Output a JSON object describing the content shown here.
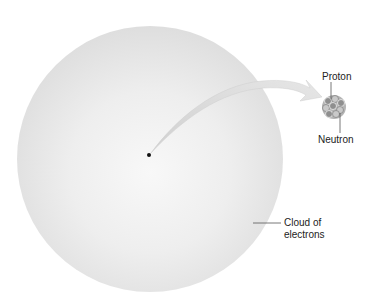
{
  "diagram": {
    "labels": {
      "proton": "Proton",
      "neutron": "Neutron",
      "cloud_line1": "Cloud of",
      "cloud_line2": "electrons"
    },
    "colors": {
      "cloud": "#e3e3e3",
      "cloud_center": "#f7f7f7",
      "arrow": "#e0e0e0",
      "nucleus": "#9a9a9a",
      "text": "#222222",
      "leader": "#555555"
    }
  }
}
